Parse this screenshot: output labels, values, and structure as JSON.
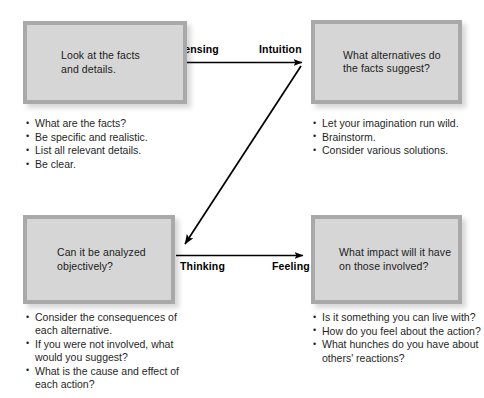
{
  "diagram": {
    "colors": {
      "box_fill": "#d6d6d6",
      "box_border": "#a9a9a9",
      "text": "#1b1b1b",
      "arrow": "#000000",
      "background": "#ffffff"
    }
  },
  "boxes": {
    "sensing": {
      "text": "Look at the facts\nand details."
    },
    "intuition": {
      "text": "What alternatives do\nthe facts suggest?"
    },
    "thinking": {
      "text": "Can it be analyzed\nobjectively?"
    },
    "feeling": {
      "text": "What impact will it have\non those involved?"
    }
  },
  "lists": {
    "sensing": [
      "What are the facts?",
      "Be specific and realistic.",
      "List all relevant details.",
      "Be clear."
    ],
    "intuition": [
      "Let your imagination run wild.",
      "Brainstorm.",
      "Consider various solutions."
    ],
    "thinking": [
      "Consider the consequences of each alternative.",
      "If you were not involved, what would you suggest?",
      "What is the cause and effect of each action?"
    ],
    "feeling": [
      "Is it something you can live with?",
      "How do you feel about the action?",
      "What hunches do you have about others' reactions?"
    ]
  },
  "arrows": {
    "top": {
      "from_label": "Sensing",
      "to_label": "Intuition"
    },
    "bottom": {
      "from_label": "Thinking",
      "to_label": "Feeling"
    }
  }
}
